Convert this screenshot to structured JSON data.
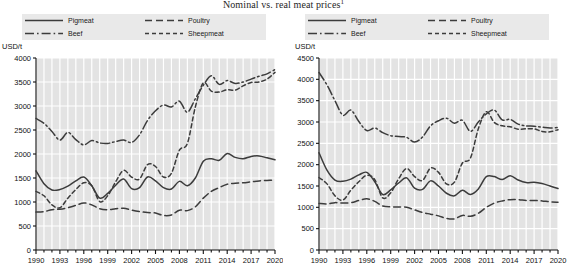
{
  "title": {
    "text": "Nominal vs. real meat prices",
    "superscript": "1"
  },
  "legend": {
    "items": [
      {
        "label": "Pigmeat",
        "style": "solid"
      },
      {
        "label": "Poultry",
        "style": "longdash"
      },
      {
        "label": "Beef",
        "style": "dashdot"
      },
      {
        "label": "Sheepmeat",
        "style": "shortdash"
      }
    ]
  },
  "chart_data": [
    {
      "id": "nominal",
      "type": "line",
      "title": "",
      "xlabel": "",
      "ylabel": "USD/t",
      "xlim": [
        1990,
        2020
      ],
      "ylim": [
        0,
        4000
      ],
      "yticks": [
        0,
        500,
        1000,
        1500,
        2000,
        2500,
        3000,
        3500,
        4000
      ],
      "xticks": [
        1990,
        1993,
        1996,
        1999,
        2002,
        2005,
        2008,
        2011,
        2014,
        2017,
        2020
      ],
      "grid": true,
      "legend_position": "top",
      "x": [
        1990,
        1991,
        1992,
        1993,
        1994,
        1995,
        1996,
        1997,
        1998,
        1999,
        2000,
        2001,
        2002,
        2003,
        2004,
        2005,
        2006,
        2007,
        2008,
        2009,
        2010,
        2011,
        2012,
        2013,
        2014,
        2015,
        2016,
        2017,
        2018,
        2019,
        2020
      ],
      "series": [
        {
          "name": "Pigmeat",
          "style": "solid",
          "values": [
            1650,
            1380,
            1250,
            1260,
            1330,
            1440,
            1520,
            1340,
            1080,
            1180,
            1350,
            1480,
            1280,
            1300,
            1520,
            1440,
            1300,
            1270,
            1430,
            1340,
            1500,
            1850,
            1900,
            1870,
            2010,
            1930,
            1900,
            1950,
            1960,
            1920,
            1880
          ]
        },
        {
          "name": "Beef",
          "style": "dashdot",
          "values": [
            2740,
            2640,
            2470,
            2290,
            2450,
            2300,
            2190,
            2280,
            2230,
            2220,
            2260,
            2290,
            2240,
            2400,
            2700,
            2900,
            3020,
            2980,
            3100,
            2870,
            3150,
            3430,
            3630,
            3450,
            3530,
            3470,
            3500,
            3560,
            3620,
            3670,
            3760
          ]
        },
        {
          "name": "Poultry",
          "style": "longdash",
          "values": [
            790,
            800,
            840,
            850,
            880,
            930,
            980,
            940,
            860,
            840,
            860,
            870,
            830,
            800,
            780,
            770,
            720,
            730,
            830,
            820,
            900,
            1080,
            1220,
            1300,
            1370,
            1390,
            1400,
            1420,
            1440,
            1450,
            1460
          ]
        },
        {
          "name": "Sheepmeat",
          "style": "shortdash",
          "values": [
            1220,
            1130,
            940,
            880,
            1080,
            1260,
            1400,
            1340,
            1010,
            1130,
            1420,
            1660,
            1520,
            1480,
            1780,
            1740,
            1520,
            1600,
            2080,
            2220,
            2980,
            3480,
            3310,
            3290,
            3340,
            3330,
            3420,
            3490,
            3500,
            3560,
            3700
          ]
        }
      ]
    },
    {
      "id": "real",
      "type": "line",
      "title": "",
      "xlabel": "",
      "ylabel": "USD/t",
      "xlim": [
        1990,
        2020
      ],
      "ylim": [
        0,
        4500
      ],
      "yticks": [
        0,
        500,
        1000,
        1500,
        2000,
        2500,
        3000,
        3500,
        4000,
        4500
      ],
      "xticks": [
        1990,
        1993,
        1996,
        1999,
        2002,
        2005,
        2008,
        2011,
        2014,
        2017,
        2020
      ],
      "grid": true,
      "legend_position": "top",
      "x": [
        1990,
        1991,
        1992,
        1993,
        1994,
        1995,
        1996,
        1997,
        1998,
        1999,
        2000,
        2001,
        2002,
        2003,
        2004,
        2005,
        2006,
        2007,
        2008,
        2009,
        2010,
        2011,
        2012,
        2013,
        2014,
        2015,
        2016,
        2017,
        2018,
        2019,
        2020
      ],
      "series": [
        {
          "name": "Pigmeat",
          "style": "solid",
          "values": [
            2280,
            1870,
            1640,
            1610,
            1660,
            1760,
            1820,
            1600,
            1300,
            1410,
            1570,
            1690,
            1450,
            1420,
            1620,
            1500,
            1330,
            1270,
            1400,
            1300,
            1430,
            1720,
            1720,
            1650,
            1740,
            1640,
            1580,
            1590,
            1560,
            1500,
            1440
          ]
        },
        {
          "name": "Beef",
          "style": "dashdot",
          "values": [
            4160,
            3870,
            3500,
            3160,
            3280,
            3010,
            2800,
            2860,
            2750,
            2680,
            2660,
            2640,
            2530,
            2650,
            2910,
            3030,
            3090,
            2970,
            3040,
            2780,
            3000,
            3190,
            3280,
            3050,
            3060,
            2950,
            2910,
            2900,
            2880,
            2860,
            2870
          ]
        },
        {
          "name": "Poultry",
          "style": "longdash",
          "values": [
            1090,
            1080,
            1110,
            1100,
            1110,
            1160,
            1200,
            1140,
            1030,
            1010,
            1010,
            1000,
            940,
            880,
            840,
            800,
            740,
            730,
            810,
            790,
            860,
            1000,
            1100,
            1150,
            1180,
            1180,
            1160,
            1160,
            1150,
            1130,
            1120
          ]
        },
        {
          "name": "Sheepmeat",
          "style": "shortdash",
          "values": [
            1700,
            1550,
            1270,
            1170,
            1400,
            1600,
            1750,
            1650,
            1220,
            1340,
            1670,
            1910,
            1720,
            1630,
            1920,
            1820,
            1550,
            1590,
            2040,
            2150,
            2840,
            3240,
            2990,
            2910,
            2890,
            2830,
            2840,
            2840,
            2780,
            2770,
            2820
          ]
        }
      ]
    }
  ]
}
